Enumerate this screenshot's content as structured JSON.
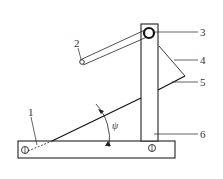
{
  "diagram": {
    "type": "mechanical-schematic",
    "labels": {
      "part1": "1",
      "part2": "2",
      "part3": "3",
      "part4": "4",
      "part5": "5",
      "part6": "6",
      "angle": "ψ"
    },
    "colors": {
      "stroke": "#222222",
      "background": "#ffffff"
    }
  }
}
